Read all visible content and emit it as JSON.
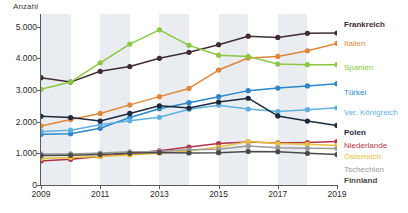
{
  "chart_data": {
    "type": "line",
    "title": "",
    "ylabel": "Anzahl",
    "xlabel": "",
    "ylim": [
      0,
      5400
    ],
    "xlim": [
      2009,
      2019
    ],
    "grid": false,
    "legend_position": "right",
    "y_ticks": [
      "0",
      "1.000",
      "2.000",
      "3.000",
      "4.000",
      "5.000"
    ],
    "y_tick_values": [
      0,
      1000,
      2000,
      3000,
      4000,
      5000
    ],
    "x": [
      2009,
      2010,
      2011,
      2012,
      2013,
      2014,
      2015,
      2016,
      2017,
      2018,
      2019
    ],
    "x_ticks": [
      "2009",
      "2011",
      "2013",
      "2015",
      "2017",
      "2019"
    ],
    "x_tick_values": [
      2009,
      2011,
      2013,
      2015,
      2017,
      2019
    ],
    "series": [
      {
        "name": "Frankreich",
        "color": "#3f2c34",
        "bold": true,
        "values": [
          3390,
          3250,
          3590,
          3740,
          4000,
          4190,
          4430,
          4700,
          4660,
          4790,
          4800
        ]
      },
      {
        "name": "Italien",
        "color": "#e0873b",
        "bold": false,
        "values": [
          1860,
          2070,
          2260,
          2530,
          2790,
          3050,
          3630,
          4010,
          4060,
          4240,
          4470
        ]
      },
      {
        "name": "Spanien",
        "color": "#8dc63f",
        "bold": false,
        "values": [
          3020,
          3250,
          3860,
          4450,
          4900,
          4410,
          4100,
          4060,
          3820,
          3800,
          3800
        ]
      },
      {
        "name": "Türkei",
        "color": "#2d86c8",
        "bold": false,
        "values": [
          1600,
          1620,
          1790,
          2130,
          2410,
          2600,
          2790,
          2980,
          3060,
          3130,
          3200
        ]
      },
      {
        "name": "Ver. Königreich",
        "color": "#5fb0e0",
        "bold": false,
        "values": [
          1690,
          1730,
          1900,
          2030,
          2140,
          2390,
          2520,
          2400,
          2320,
          2380,
          2440
        ]
      },
      {
        "name": "Polen",
        "color": "#1b2a3d",
        "bold": true,
        "values": [
          2170,
          2130,
          2020,
          2260,
          2500,
          2430,
          2620,
          2740,
          2180,
          2020,
          1880
        ]
      },
      {
        "name": "Niederlande",
        "color": "#b53349",
        "bold": false,
        "values": [
          760,
          810,
          900,
          1000,
          1080,
          1200,
          1310,
          1360,
          1330,
          1340,
          1370
        ]
      },
      {
        "name": "Österreich",
        "color": "#e6c13a",
        "bold": false,
        "values": [
          840,
          870,
          900,
          950,
          1000,
          1070,
          1200,
          1370,
          1310,
          1290,
          1250
        ]
      },
      {
        "name": "Tschechien",
        "color": "#9b9b9b",
        "bold": false,
        "values": [
          980,
          980,
          1010,
          1050,
          1060,
          1110,
          1130,
          1230,
          1180,
          1160,
          1150
        ]
      },
      {
        "name": "Finnland",
        "color": "#4b4b4b",
        "bold": true,
        "values": [
          930,
          940,
          960,
          1000,
          1030,
          1010,
          1020,
          1060,
          1050,
          1000,
          960
        ]
      }
    ],
    "legend_labels": [
      {
        "text": "Frankreich",
        "color": "#3f2c34",
        "bold": true,
        "top": 21
      },
      {
        "text": "Italien",
        "color": "#e0873b",
        "bold": false,
        "top": 40
      },
      {
        "text": "Spanien",
        "color": "#8dc63f",
        "bold": false,
        "top": 64
      },
      {
        "text": "Türkei",
        "color": "#2d86c8",
        "bold": false,
        "top": 89
      },
      {
        "text": "Ver. Königreich",
        "color": "#5fb0e0",
        "bold": false,
        "top": 109
      },
      {
        "text": "Polen",
        "color": "#1b2a3d",
        "bold": true,
        "top": 129
      },
      {
        "text": "Niederlande",
        "color": "#b53349",
        "bold": false,
        "top": 142
      },
      {
        "text": "Österreich",
        "color": "#e6c13a",
        "bold": false,
        "top": 153
      },
      {
        "text": "Tschechien",
        "color": "#9b9b9b",
        "bold": false,
        "top": 166
      },
      {
        "text": "Finnland",
        "color": "#4b4b4b",
        "bold": true,
        "top": 177
      }
    ],
    "background_bands_color": "#e9edf2"
  }
}
